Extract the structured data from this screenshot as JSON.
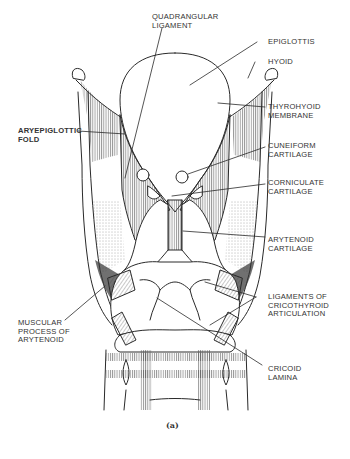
{
  "figure": {
    "caption": "(a)",
    "stroke_color": "#2a2a2a",
    "background": "#ffffff"
  },
  "labels": {
    "quadrangular_ligament": [
      "QUADRANGULAR",
      "LIGAMENT"
    ],
    "epiglottis": [
      "EPIGLOTTIS"
    ],
    "hyoid": [
      "HYOID"
    ],
    "thyrohyoid_membrane": [
      "THYROHYOID",
      "MEMBRANE"
    ],
    "aryepiglottic_fold": [
      "ARYEPIGLOTTIC",
      "FOLD"
    ],
    "cuneiform_cartilage": [
      "CUNEIFORM",
      "CARTILAGE"
    ],
    "corniculate_cartilage": [
      "CORNICULATE",
      "CARTILAGE"
    ],
    "arytenoid_cartilage": [
      "ARYTENOID",
      "CARTILAGE"
    ],
    "ligaments_cricothyroid": [
      "LIGAMENTS OF",
      "CRICOTHYROID",
      "ARTICULATION"
    ],
    "muscular_process": [
      "MUSCULAR",
      "PROCESS OF",
      "ARYTENOID"
    ],
    "cricoid_lamina": [
      "CRICOID",
      "LAMINA"
    ]
  }
}
